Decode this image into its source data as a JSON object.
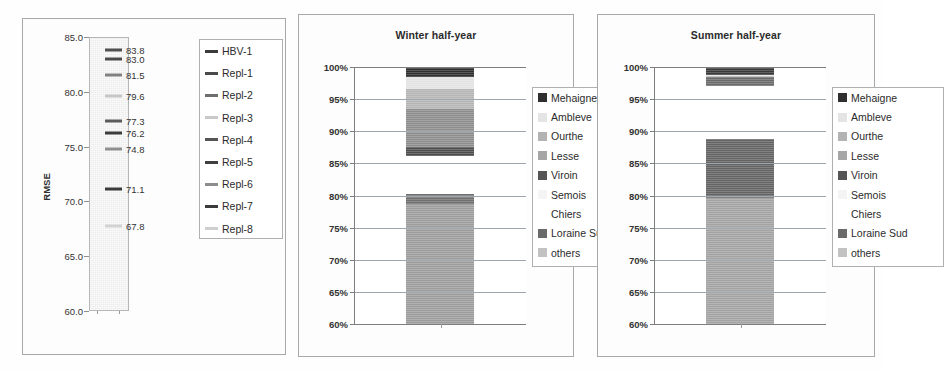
{
  "figure": {
    "panels": [
      "rmse-panel",
      "winter-panel",
      "summer-panel"
    ]
  },
  "panel1": {
    "title": "",
    "axis_title": "RMSE",
    "y_ticks": [
      "85.0",
      "80.0",
      "75.0",
      "70.0",
      "65.0",
      "60.0"
    ],
    "legend": [
      {
        "label": "HBV-1",
        "color": "#3b3b3b"
      },
      {
        "label": "Repl-1",
        "color": "#4a4a4a"
      },
      {
        "label": "Repl-2",
        "color": "#6e6e6e"
      },
      {
        "label": "Repl-3",
        "color": "#c9c9c9"
      },
      {
        "label": "Repl-4",
        "color": "#555555"
      },
      {
        "label": "Repl-5",
        "color": "#3f3f3f"
      },
      {
        "label": "Repl-6",
        "color": "#8d8d8d"
      },
      {
        "label": "Repl-7",
        "color": "#3b3b3b"
      },
      {
        "label": "Repl-8",
        "color": "#cfcfcf"
      }
    ],
    "markers": [
      {
        "label": "83.8",
        "value": 83.8,
        "color": "#4f4f4f"
      },
      {
        "label": "83.0",
        "value": 83.0,
        "color": "#4a4a4a"
      },
      {
        "label": "81.5",
        "value": 81.5,
        "color": "#818181"
      },
      {
        "label": "79.6",
        "value": 79.6,
        "color": "#c6c6c6"
      },
      {
        "label": "77.3",
        "value": 77.3,
        "color": "#5b5b5b"
      },
      {
        "label": "76.2",
        "value": 76.2,
        "color": "#3c3c3c"
      },
      {
        "label": "74.8",
        "value": 74.8,
        "color": "#8f8f8f"
      },
      {
        "label": "71.1",
        "value": 71.1,
        "color": "#3a3a3a"
      },
      {
        "label": "67.8",
        "value": 67.8,
        "color": "#d2d2d2"
      }
    ]
  },
  "chart_data": [
    {
      "type": "bar",
      "title": "",
      "ylabel": "RMSE",
      "xlabel": "",
      "ylim": [
        60.0,
        85.0
      ],
      "ytick_labels": [
        "60.0",
        "65.0",
        "70.0",
        "75.0",
        "80.0",
        "85.0"
      ],
      "grid": false,
      "legend_position": "right",
      "legend_entries": [
        "HBV-1",
        "Repl-1",
        "Repl-2",
        "Repl-3",
        "Repl-4",
        "Repl-5",
        "Repl-6",
        "Repl-7",
        "Repl-8"
      ],
      "categories": [
        "HBV-1",
        "Repl-1",
        "Repl-2",
        "Repl-3",
        "Repl-4",
        "Repl-5",
        "Repl-6",
        "Repl-7",
        "Repl-8"
      ],
      "values": [
        83.8,
        83.0,
        81.5,
        79.6,
        77.3,
        76.2,
        74.8,
        71.1,
        67.8
      ],
      "data_labels": [
        "83.8",
        "83.0",
        "81.5",
        "79.6",
        "77.3",
        "76.2",
        "74.8",
        "71.1",
        "67.8"
      ]
    },
    {
      "type": "bar",
      "title": "Winter half-year",
      "ylabel": "",
      "xlabel": "",
      "ylim": [
        60,
        100
      ],
      "ytick_labels": [
        "60%",
        "65%",
        "70%",
        "75%",
        "80%",
        "85%",
        "90%",
        "95%",
        "100%"
      ],
      "grid": true,
      "legend_position": "right",
      "stacked": true,
      "categories": [
        "Winter half-year"
      ],
      "series": [
        {
          "name": "others",
          "values": [
            18.7
          ],
          "from": 60.0,
          "to": 78.7,
          "color": "#9c9c9c"
        },
        {
          "name": "Loraine Sud",
          "values": [
            1.5
          ],
          "from": 78.7,
          "to": 80.2,
          "color": "#6f6f6f"
        },
        {
          "name": "Chiers",
          "values": [
            0.0
          ],
          "from": 80.2,
          "to": 80.2,
          "color": "#ffffff"
        },
        {
          "name": "Semois",
          "values": [
            0.0
          ],
          "from": 80.2,
          "to": 80.2,
          "color": "#fafafa"
        },
        {
          "name": "Viroin",
          "values": [
            1.4
          ],
          "from": 86.2,
          "to": 87.6,
          "color": "#4e4e4e"
        },
        {
          "name": "Lesse",
          "values": [
            5.8
          ],
          "from": 87.6,
          "to": 93.4,
          "color": "#8d8d8d"
        },
        {
          "name": "Ourthe",
          "values": [
            3.2
          ],
          "from": 93.4,
          "to": 96.6,
          "color": "#b5b5b5"
        },
        {
          "name": "Ambleve",
          "values": [
            1.8
          ],
          "from": 96.6,
          "to": 98.4,
          "color": "#e3e3e3"
        },
        {
          "name": "Mehaigne",
          "values": [
            1.6
          ],
          "from": 98.4,
          "to": 100.0,
          "color": "#2f2f2f"
        }
      ],
      "legend_entries": [
        "Mehaigne",
        "Ambleve",
        "Ourthe",
        "Lesse",
        "Viroin",
        "Semois",
        "Chiers",
        "Loraine Sud",
        "others"
      ]
    },
    {
      "type": "bar",
      "title": "Summer half-year",
      "ylabel": "",
      "xlabel": "",
      "ylim": [
        60,
        100
      ],
      "ytick_labels": [
        "60%",
        "65%",
        "70%",
        "75%",
        "80%",
        "85%",
        "90%",
        "95%",
        "100%"
      ],
      "grid": true,
      "legend_position": "right",
      "stacked": true,
      "categories": [
        "Summer half-year"
      ],
      "series": [
        {
          "name": "others",
          "values": [
            19.6
          ],
          "from": 60.0,
          "to": 79.6,
          "color": "#a3a3a3"
        },
        {
          "name": "Loraine Sud",
          "values": [
            9.2
          ],
          "from": 79.6,
          "to": 88.8,
          "color": "#636363"
        },
        {
          "name": "Chiers",
          "values": [
            0.0
          ],
          "from": 88.8,
          "to": 88.8,
          "color": "#ffffff"
        },
        {
          "name": "Semois",
          "values": [
            0.0
          ],
          "from": 88.8,
          "to": 88.8,
          "color": "#fafafa"
        },
        {
          "name": "Viroin",
          "values": [
            0.0
          ],
          "from": 97.0,
          "to": 97.0,
          "color": "#4e4e4e"
        },
        {
          "name": "Lesse",
          "values": [
            1.4
          ],
          "from": 97.0,
          "to": 98.4,
          "color": "#6a6a6a"
        },
        {
          "name": "Ourthe",
          "values": [
            0.0
          ],
          "from": 98.4,
          "to": 98.6,
          "color": "#b5b5b5"
        },
        {
          "name": "Ambleve",
          "values": [
            0.2
          ],
          "from": 98.6,
          "to": 98.8,
          "color": "#e3e3e3"
        },
        {
          "name": "Mehaigne",
          "values": [
            1.2
          ],
          "from": 98.8,
          "to": 100.0,
          "color": "#3a3a3a"
        }
      ],
      "legend_entries": [
        "Mehaigne",
        "Ambleve",
        "Ourthe",
        "Lesse",
        "Viroin",
        "Semois",
        "Chiers",
        "Loraine Sud",
        "others"
      ]
    }
  ],
  "shared_legend": [
    {
      "label": "Mehaigne",
      "color": "#2f2f2f",
      "swatch": true
    },
    {
      "label": "Ambleve",
      "color": "#e4e4e4",
      "swatch": true
    },
    {
      "label": "Ourthe",
      "color": "#b3b3b3",
      "swatch": true
    },
    {
      "label": "Lesse",
      "color": "#a6a6a6",
      "swatch": true
    },
    {
      "label": "Viroin",
      "color": "#555555",
      "swatch": true
    },
    {
      "label": "Semois",
      "color": "#f4f4f4",
      "swatch": true
    },
    {
      "label": "Chiers",
      "color": "#ffffff",
      "swatch": false
    },
    {
      "label": "Loraine Sud",
      "color": "#6a6a6a",
      "swatch": true
    },
    {
      "label": "others",
      "color": "#c2c2c2",
      "swatch": true
    }
  ]
}
